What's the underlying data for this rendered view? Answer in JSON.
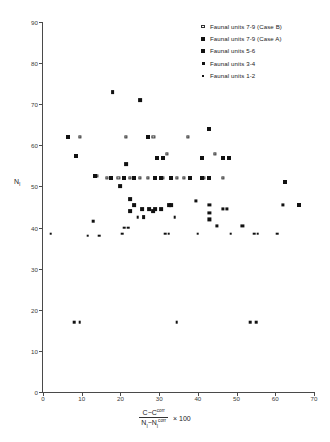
{
  "chart_data": {
    "type": "scatter",
    "title": "",
    "xlabel": "(C - C^corr) / (N_I - N_I^corr) x 100",
    "ylabel": "N_I",
    "xlim": [
      0,
      70
    ],
    "ylim": [
      0,
      90
    ],
    "xticks": [
      0,
      10,
      20,
      30,
      40,
      50,
      60,
      70
    ],
    "yticks": [
      0,
      10,
      20,
      30,
      40,
      50,
      60,
      70,
      80,
      90
    ],
    "grid": false,
    "legend_position": "top-right",
    "series": [
      {
        "name": "Faunal units 7-9 (Case B)",
        "marker": "open-square",
        "size": 3,
        "points": [
          [
            9.5,
            62.0
          ],
          [
            21.5,
            62.0
          ],
          [
            28.5,
            62.0
          ],
          [
            37.5,
            62.0
          ],
          [
            32.0,
            58.0
          ],
          [
            44.5,
            58.0
          ],
          [
            14.0,
            52.5
          ],
          [
            16.5,
            52.0
          ],
          [
            19.5,
            52.0
          ],
          [
            22.5,
            52.0
          ],
          [
            25.0,
            52.0
          ],
          [
            27.0,
            52.0
          ],
          [
            31.0,
            52.0
          ],
          [
            34.5,
            52.0
          ],
          [
            36.5,
            52.0
          ],
          [
            41.5,
            52.0
          ],
          [
            46.5,
            52.0
          ]
        ]
      },
      {
        "name": "Faunal units 7-9 (Case A)",
        "marker": "filled-square",
        "size": 5,
        "points": [
          [
            6.5,
            62.0
          ],
          [
            27.0,
            62.0
          ],
          [
            43.0,
            64.0
          ],
          [
            8.5,
            57.5
          ],
          [
            29.5,
            57.0
          ],
          [
            31.0,
            57.0
          ],
          [
            41.0,
            57.0
          ],
          [
            46.5,
            57.0
          ],
          [
            48.0,
            57.0
          ],
          [
            13.5,
            52.5
          ],
          [
            17.5,
            52.0
          ],
          [
            21.0,
            52.0
          ],
          [
            23.5,
            52.0
          ],
          [
            29.0,
            52.0
          ],
          [
            30.5,
            52.0
          ],
          [
            33.0,
            52.0
          ],
          [
            38.0,
            52.0
          ],
          [
            41.0,
            52.0
          ],
          [
            43.0,
            52.0
          ],
          [
            62.5,
            51.0
          ],
          [
            66.0,
            45.5
          ]
        ]
      },
      {
        "name": "Faunal units 5-6",
        "marker": "filled-square",
        "size": 4,
        "points": [
          [
            18.0,
            73.0
          ],
          [
            25.0,
            71.0
          ],
          [
            21.5,
            55.5
          ],
          [
            20.0,
            50.0
          ],
          [
            22.5,
            47.0
          ],
          [
            23.5,
            45.5
          ],
          [
            25.5,
            44.5
          ],
          [
            22.5,
            44.0
          ],
          [
            27.5,
            44.5
          ],
          [
            29.0,
            44.5
          ],
          [
            30.5,
            44.5
          ],
          [
            32.5,
            45.5
          ],
          [
            33.0,
            45.5
          ],
          [
            26.0,
            42.5
          ],
          [
            28.5,
            44.0
          ]
        ]
      },
      {
        "name": "Faunal units 3-4",
        "marker": "filled-square",
        "size": 3,
        "points": [
          [
            43.0,
            45.5
          ],
          [
            43.0,
            43.5
          ],
          [
            43.0,
            42.0
          ],
          [
            46.5,
            44.5
          ],
          [
            47.5,
            44.5
          ],
          [
            39.5,
            46.5
          ],
          [
            62.0,
            45.5
          ],
          [
            45.0,
            40.5
          ],
          [
            51.5,
            40.5
          ]
        ]
      },
      {
        "name": "Faunal units 1-2",
        "marker": "filled-square",
        "size": 2,
        "points": [
          [
            2.0,
            38.5
          ],
          [
            11.5,
            38.0
          ],
          [
            14.5,
            38.0
          ],
          [
            13.0,
            41.5
          ],
          [
            21.0,
            40.0
          ],
          [
            22.0,
            40.0
          ],
          [
            20.5,
            38.5
          ],
          [
            24.5,
            42.5
          ],
          [
            31.5,
            38.5
          ],
          [
            32.5,
            38.5
          ],
          [
            34.0,
            42.5
          ],
          [
            40.0,
            38.5
          ],
          [
            48.5,
            38.5
          ],
          [
            54.5,
            38.5
          ],
          [
            55.5,
            38.5
          ],
          [
            60.5,
            38.5
          ],
          [
            8.0,
            17.0
          ],
          [
            9.5,
            17.0
          ],
          [
            34.5,
            17.0
          ],
          [
            53.5,
            17.0
          ],
          [
            55.0,
            17.0
          ]
        ]
      }
    ]
  },
  "legend": {
    "items": [
      {
        "label": "Faunal units 7-9 (Case B)",
        "marker": "open-square"
      },
      {
        "label": "Faunal units 7-9 (Case A)",
        "marker": "filled-square-large"
      },
      {
        "label": "Faunal units 5-6",
        "marker": "filled-square-medium"
      },
      {
        "label": "Faunal units 3-4",
        "marker": "filled-square-small"
      },
      {
        "label": "Faunal units 1-2",
        "marker": "filled-square-tiny"
      }
    ]
  },
  "axis": {
    "y_title": "N",
    "y_title_sub": "I",
    "x_formula": {
      "numerator_a": "C",
      "numerator_b": "C",
      "numerator_b_sup": "corr",
      "denominator_a": "N",
      "denominator_a_sub": "I",
      "denominator_b": "N",
      "denominator_b_sub": "I",
      "denominator_b_sup": "corr",
      "minus": "−",
      "multiplier": "× 100"
    }
  },
  "colors": {
    "marker": "#111111",
    "axis": "#4a4a4a",
    "background": "#ffffff"
  }
}
